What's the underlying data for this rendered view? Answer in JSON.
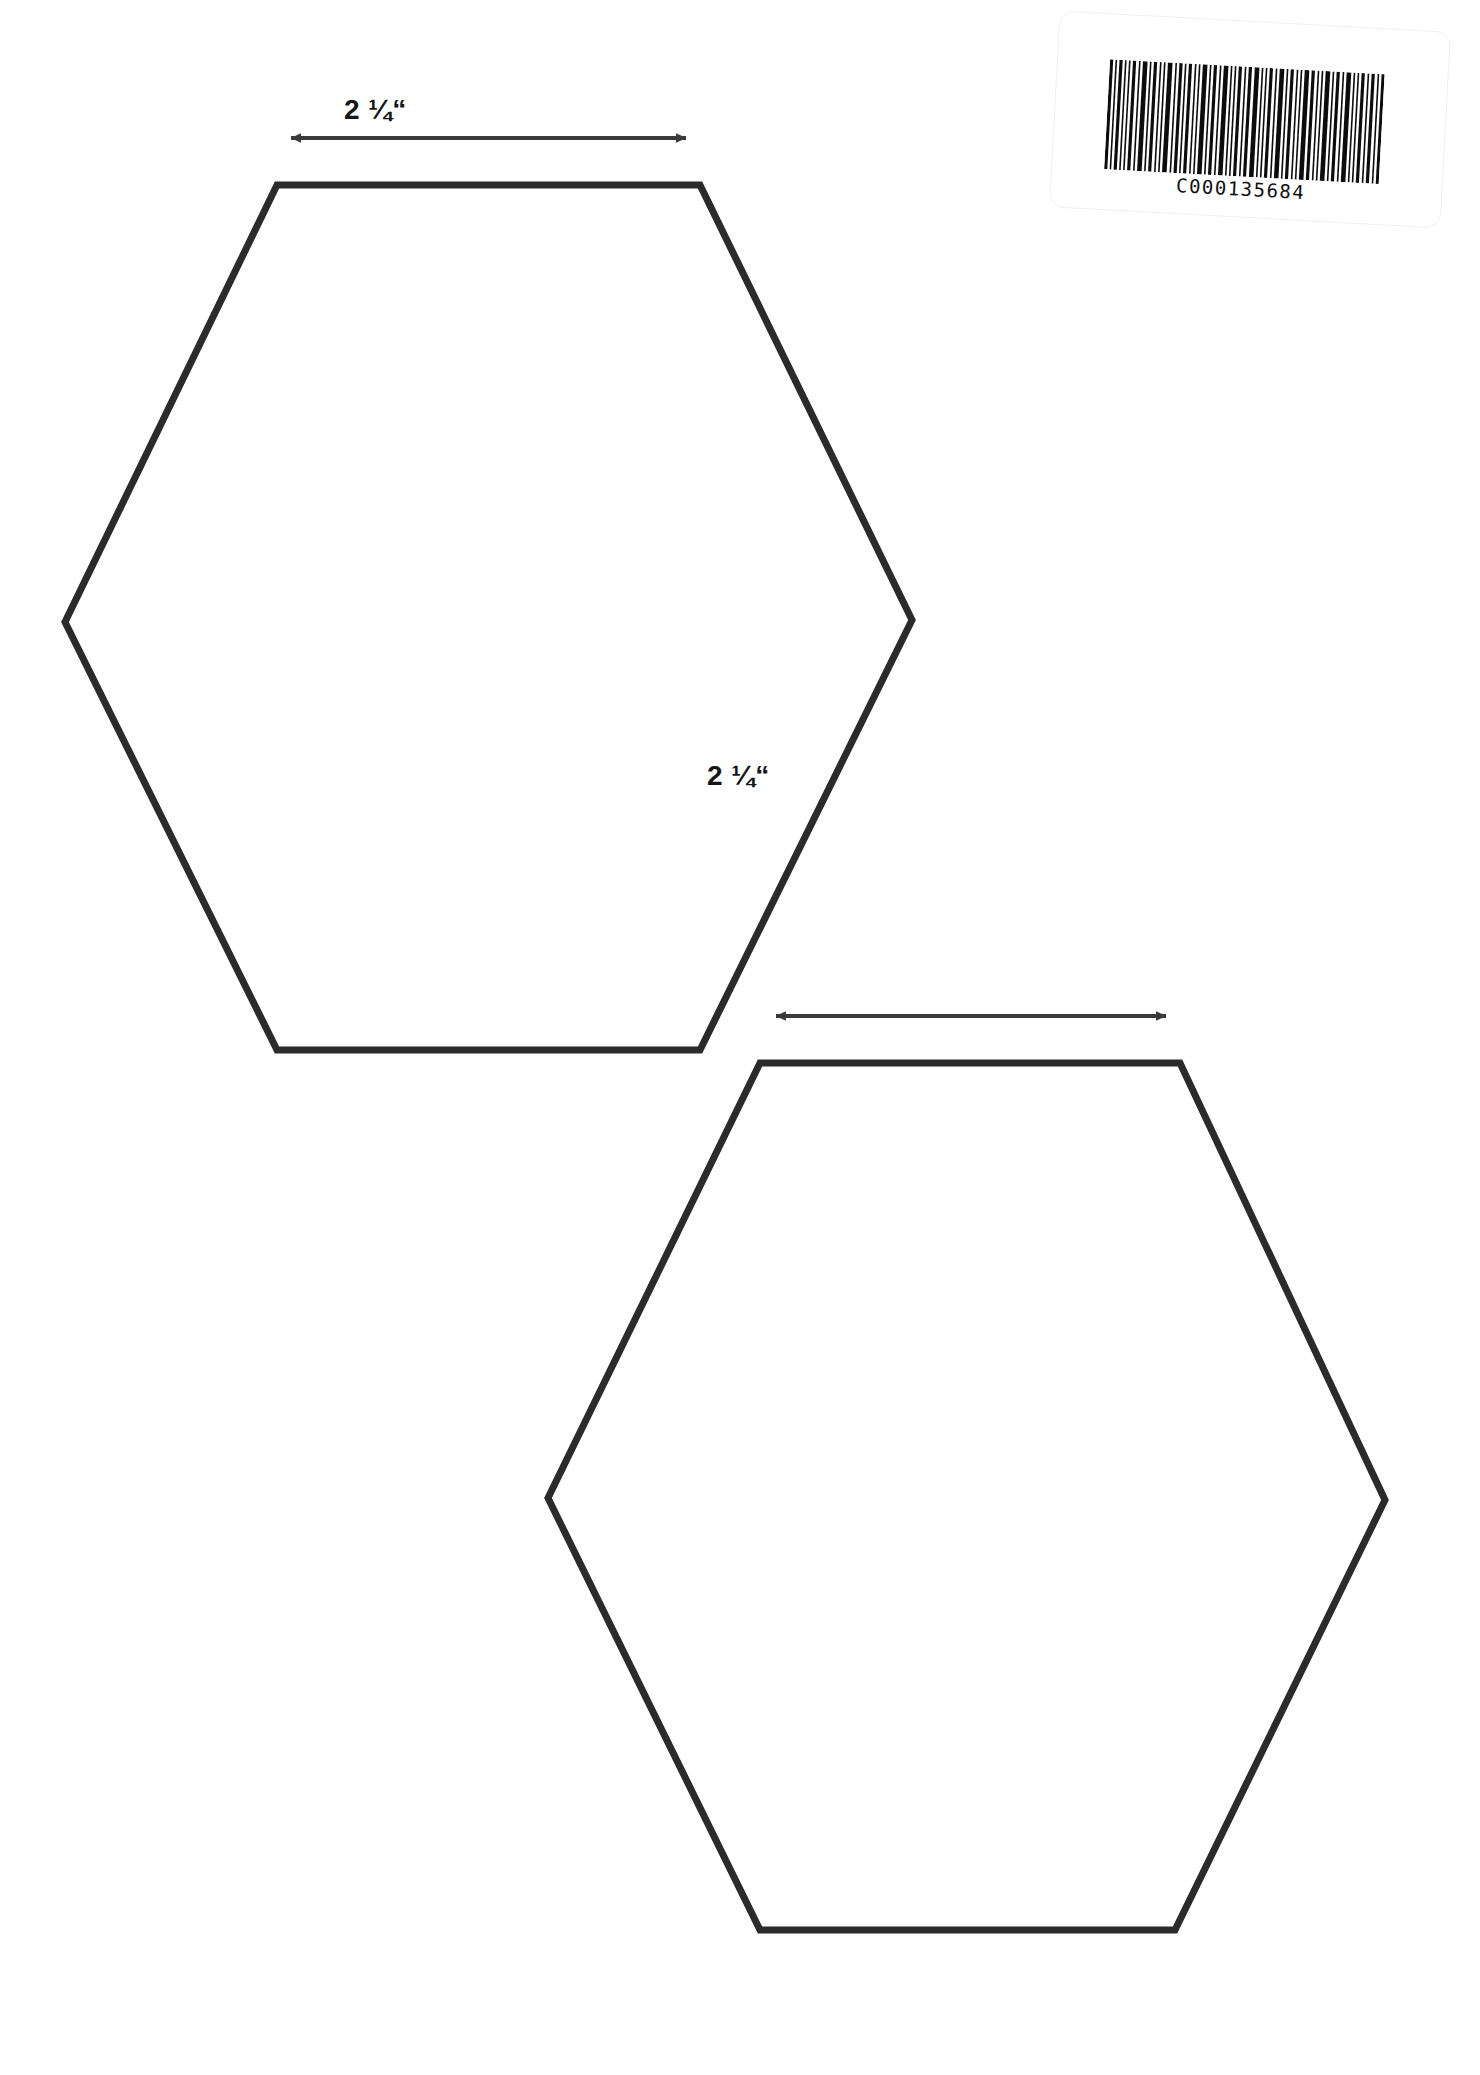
{
  "document": {
    "type": "hexagon-template-sheet",
    "background_color": "#ffffff",
    "stroke_color": "#2b2b2b",
    "width": 1480,
    "height": 2075
  },
  "barcode": {
    "name": "inventory-barcode-sticker",
    "number": "C000135684",
    "symbology_look": "code-128",
    "rotation_degrees": 3.1,
    "bar_color": "#0d0d0d",
    "label_background": "#ffffff"
  },
  "shapes": [
    {
      "name": "hexagon-top-left",
      "type": "hexagon",
      "orientation": "pointy-side",
      "top_edge_y": 185,
      "bottom_edge_y": 1050,
      "top_edge_left_x": 277,
      "top_edge_right_x": 700,
      "left_vertex": [
        65,
        622
      ],
      "right_vertex": [
        912,
        620
      ],
      "stroke_width": 7,
      "fill": "none"
    },
    {
      "name": "hexagon-bottom-right",
      "type": "hexagon",
      "orientation": "pointy-side",
      "top_edge_y": 1063,
      "bottom_edge_y": 1930,
      "top_edge_left_x": 760,
      "top_edge_right_x": 1180,
      "left_vertex": [
        548,
        1498
      ],
      "right_vertex": [
        1385,
        1500
      ],
      "stroke_width": 7,
      "fill": "none"
    }
  ],
  "dimensions": [
    {
      "name": "dimension-hexagon-top-left",
      "label": "2 ¼“",
      "value_text": "2 ¼",
      "unit_mark": "“",
      "measured_edge": "top",
      "arrow_y": 138,
      "arrow_start_x": 285,
      "arrow_end_x": 692,
      "arrow_color": "#3a3a3a"
    },
    {
      "name": "dimension-hexagon-bottom-right",
      "label": "2 ¼“",
      "value_text": "2 ¼",
      "unit_mark": "“",
      "measured_edge": "top",
      "arrow_y": 1016,
      "arrow_start_x": 770,
      "arrow_end_x": 1172,
      "arrow_color": "#3a3a3a"
    }
  ]
}
